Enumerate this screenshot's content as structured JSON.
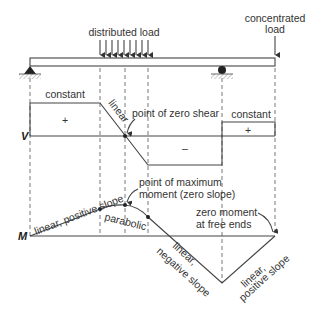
{
  "labels": {
    "distributed_load": "distributed load",
    "concentrated_load_1": "concentrated",
    "concentrated_load_2": "load",
    "v_axis": "V",
    "m_axis": "M",
    "constant_left": "constant",
    "constant_right": "constant",
    "linear_shear": "linear",
    "zero_shear": "point of zero shear",
    "plus_left": "+",
    "plus_right": "+",
    "minus": "–",
    "max_moment_1": "point of maximum",
    "max_moment_2": "moment (zero slope)",
    "linear_pos_slope": "linear, positive slope",
    "parabolic": "parabolic",
    "zero_moment_1": "zero moment",
    "zero_moment_2": "at free ends",
    "linear_neg_1": "linear,",
    "linear_neg_2": "negative slope",
    "linear_pos_1": "linear,",
    "linear_pos_2": "positive slope"
  },
  "colors": {
    "line": "#444444",
    "text": "#333333"
  }
}
